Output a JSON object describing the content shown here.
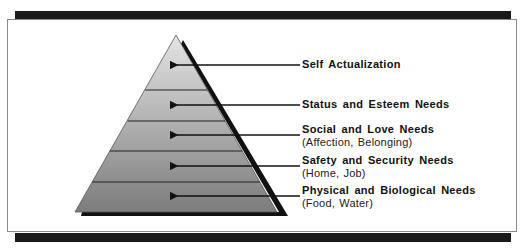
{
  "diagram": {
    "type": "pyramid",
    "title": "",
    "colors": {
      "frame_bar": "#1a1a1a",
      "frame_border": "#8a8a8a",
      "pyramid_top": "#e2e2e2",
      "pyramid_bottom": "#7e7e7e",
      "shadow": "#111111",
      "text": "#111111"
    },
    "levels": [
      {
        "title": "Self Actualization",
        "subtitle": ""
      },
      {
        "title": "Status and Esteem Needs",
        "subtitle": ""
      },
      {
        "title": "Social and Love Needs",
        "subtitle": "(Affection,  Belonging)"
      },
      {
        "title": "Safety and Security Needs",
        "subtitle": "(Home,  Job)"
      },
      {
        "title": "Physical and Biological Needs",
        "subtitle": "(Food,  Water)"
      }
    ]
  }
}
